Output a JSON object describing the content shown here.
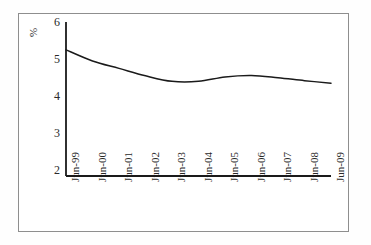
{
  "chart_data": {
    "type": "line",
    "title": "",
    "subtitle": "",
    "xlabel": "",
    "ylabel": "%",
    "unit_label": "%",
    "grid": false,
    "legend": false,
    "legend_position": "none",
    "xlim_categories": [
      "Jun-99",
      "Jun-09"
    ],
    "ylim": [
      2,
      6
    ],
    "yticks": [
      6,
      5,
      4,
      3,
      2
    ],
    "ytick_labels": [
      "6",
      "5",
      "4",
      "3",
      "2"
    ],
    "axis_origin_value": 1.85,
    "categories": [
      "Jun-99",
      "Jun-00",
      "Jun-01",
      "Jun-02",
      "Jun-03",
      "Jun-04",
      "Jun-05",
      "Jun-06",
      "Jun-07",
      "Jun-08",
      "Jun-09"
    ],
    "values": [
      5.25,
      4.95,
      4.75,
      4.55,
      4.4,
      4.4,
      4.52,
      4.56,
      4.5,
      4.42,
      4.35
    ],
    "series": [
      {
        "name": "",
        "color": "#1a1a1a",
        "values": [
          5.25,
          4.95,
          4.75,
          4.55,
          4.4,
          4.4,
          4.52,
          4.56,
          4.5,
          4.42,
          4.35
        ]
      }
    ]
  },
  "colors": {
    "line": "#1a1a1a",
    "axis": "#1a1a1a",
    "frame": "#8e8e8e",
    "text": "#2a2a2a",
    "background": "#ffffff"
  }
}
